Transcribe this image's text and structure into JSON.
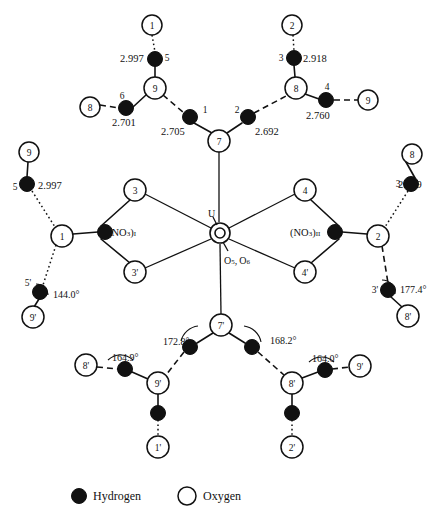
{
  "page": {
    "corner_mark": "",
    "figure_type": "molecular-hydrogen-bonding-diagram"
  },
  "legend": {
    "hydrogen_label": "Hydrogen",
    "oxygen_label": "Oxygen",
    "hydrogen_color": "#111111",
    "oxygen_color": "#ffffff"
  },
  "center": {
    "metal_label": "U",
    "axial_oxygen_label": "O",
    "axial_oxygen_sub": "5, 6",
    "axial_oxygen_full": "O5, O6"
  },
  "nitrate_groups": [
    {
      "name": "(NO3)I",
      "base": "(NO",
      "sub1": "3",
      "close": ")",
      "sub2": "I",
      "x": 108,
      "y": 232
    },
    {
      "name": "(NO3)II",
      "base": "(NO",
      "sub1": "3",
      "close": ")",
      "sub2": "II",
      "x": 283,
      "y": 232
    }
  ],
  "oxygen_atoms": [
    {
      "id": "O1-top",
      "label": "1",
      "x": 152,
      "y": 25,
      "r": 10
    },
    {
      "id": "O2-top",
      "label": "2",
      "x": 292,
      "y": 25,
      "r": 10
    },
    {
      "id": "O9-top",
      "label": "9",
      "x": 155,
      "y": 88,
      "r": 11
    },
    {
      "id": "O8-top",
      "label": "8",
      "x": 296,
      "y": 88,
      "r": 11
    },
    {
      "id": "O8-left",
      "label": "8",
      "x": 90,
      "y": 107,
      "r": 10
    },
    {
      "id": "O9-right",
      "label": "9",
      "x": 368,
      "y": 100,
      "r": 10
    },
    {
      "id": "O7",
      "label": "7",
      "x": 219,
      "y": 141,
      "r": 11
    },
    {
      "id": "O9-upleft",
      "label": "9",
      "x": 29,
      "y": 152,
      "r": 10
    },
    {
      "id": "O8-upright",
      "label": "8",
      "x": 412,
      "y": 154,
      "r": 10
    },
    {
      "id": "O1-left",
      "label": "1",
      "x": 62,
      "y": 236,
      "r": 11
    },
    {
      "id": "O2-right",
      "label": "2",
      "x": 378,
      "y": 236,
      "r": 11
    },
    {
      "id": "O3",
      "label": "3",
      "x": 135,
      "y": 190,
      "r": 11
    },
    {
      "id": "O3p",
      "label": "3'",
      "x": 135,
      "y": 272,
      "r": 11
    },
    {
      "id": "O4",
      "label": "4",
      "x": 305,
      "y": 190,
      "r": 11
    },
    {
      "id": "O4p",
      "label": "4'",
      "x": 305,
      "y": 272,
      "r": 11
    },
    {
      "id": "O9p-left",
      "label": "9'",
      "x": 33,
      "y": 317,
      "r": 11
    },
    {
      "id": "O8p-right",
      "label": "8'",
      "x": 408,
      "y": 316,
      "r": 11
    },
    {
      "id": "O7p",
      "label": "7'",
      "x": 221,
      "y": 325,
      "r": 11
    },
    {
      "id": "O9p-mid",
      "label": "9'",
      "x": 158,
      "y": 383,
      "r": 11
    },
    {
      "id": "O8p-mid",
      "label": "8'",
      "x": 292,
      "y": 383,
      "r": 11
    },
    {
      "id": "O8p-far",
      "label": "8'",
      "x": 86,
      "y": 365,
      "r": 11
    },
    {
      "id": "O9p-far",
      "label": "9'",
      "x": 360,
      "y": 366,
      "r": 11
    },
    {
      "id": "O1p",
      "label": "1'",
      "x": 158,
      "y": 447,
      "r": 11
    },
    {
      "id": "O2p",
      "label": "2'",
      "x": 292,
      "y": 447,
      "r": 11
    }
  ],
  "hydrogen_atoms": [
    {
      "id": "H5-top",
      "label": "5",
      "label_x": 167,
      "label_y": 58,
      "x": 155,
      "y": 59,
      "r": 7.5
    },
    {
      "id": "H3-top",
      "label": "3",
      "label_x": 281,
      "label_y": 58,
      "x": 294,
      "y": 58,
      "r": 7.5
    },
    {
      "id": "H6",
      "label": "6",
      "label_x": 122,
      "label_y": 96,
      "x": 126,
      "y": 108,
      "r": 7.5
    },
    {
      "id": "H4",
      "label": "4",
      "label_x": 327,
      "label_y": 87,
      "x": 326,
      "y": 100,
      "r": 7.5
    },
    {
      "id": "H1",
      "label": "1",
      "label_x": 205,
      "label_y": 110,
      "x": 190,
      "y": 117,
      "r": 7.5
    },
    {
      "id": "H2",
      "label": "2",
      "label_x": 237,
      "label_y": 110,
      "x": 248,
      "y": 117,
      "r": 7.5
    },
    {
      "id": "H5-left",
      "label": "5",
      "label_x": 15,
      "label_y": 187,
      "x": 27,
      "y": 184,
      "r": 7.5
    },
    {
      "id": "H3-right",
      "label": "3",
      "label_x": 398,
      "label_y": 184,
      "x": 411,
      "y": 184,
      "r": 7.5
    },
    {
      "id": "H-no3-1",
      "label": "",
      "label_x": 0,
      "label_y": 0,
      "x": 105,
      "y": 232,
      "r": 7.5
    },
    {
      "id": "H-no3-2",
      "label": "",
      "label_x": 0,
      "label_y": 0,
      "x": 335,
      "y": 232,
      "r": 7.5
    },
    {
      "id": "H5p",
      "label": "5'",
      "label_x": 28,
      "label_y": 283,
      "x": 40,
      "y": 292,
      "r": 7.5
    },
    {
      "id": "H3p",
      "label": "3'",
      "label_x": 375,
      "label_y": 290,
      "x": 388,
      "y": 290,
      "r": 7.5
    },
    {
      "id": "H-7p-left",
      "label": "",
      "label_x": 0,
      "label_y": 0,
      "x": 190,
      "y": 347,
      "r": 7.5
    },
    {
      "id": "H-7p-right",
      "label": "",
      "label_x": 0,
      "label_y": 0,
      "x": 252,
      "y": 347,
      "r": 7.5
    },
    {
      "id": "H-9p-left",
      "label": "",
      "label_x": 0,
      "label_y": 0,
      "x": 125,
      "y": 369,
      "r": 7.5
    },
    {
      "id": "H-8p-right",
      "label": "",
      "label_x": 0,
      "label_y": 0,
      "x": 325,
      "y": 370,
      "r": 7.5
    },
    {
      "id": "H-9p-down",
      "label": "",
      "label_x": 0,
      "label_y": 0,
      "x": 158,
      "y": 413,
      "r": 7.5
    },
    {
      "id": "H-8p-down",
      "label": "",
      "label_x": 0,
      "label_y": 0,
      "x": 292,
      "y": 413,
      "r": 7.5
    }
  ],
  "distances": [
    {
      "value": "2.997",
      "x": 120,
      "y": 58,
      "anchor": "start"
    },
    {
      "value": "2.918",
      "x": 303,
      "y": 58,
      "anchor": "start"
    },
    {
      "value": "2.701",
      "x": 112,
      "y": 122,
      "anchor": "start"
    },
    {
      "value": "2.760",
      "x": 306,
      "y": 115,
      "anchor": "start"
    },
    {
      "value": "2.705",
      "x": 161,
      "y": 131,
      "anchor": "start"
    },
    {
      "value": "2.692",
      "x": 255,
      "y": 131,
      "anchor": "start"
    },
    {
      "value": "2.997",
      "x": 38,
      "y": 185,
      "anchor": "start"
    },
    {
      "value": "2.919",
      "x": 398,
      "y": 184,
      "anchor": "start"
    }
  ],
  "angles": [
    {
      "value": "144.0°",
      "x": 53,
      "y": 294
    },
    {
      "value": "177.4°",
      "x": 400,
      "y": 289
    },
    {
      "value": "172.8°",
      "x": 163,
      "y": 341
    },
    {
      "value": "168.2°",
      "x": 270,
      "y": 340
    },
    {
      "value": "164.9°",
      "x": 112,
      "y": 357
    },
    {
      "value": "164.0°",
      "x": 312,
      "y": 358
    }
  ],
  "chart_data": {
    "type": "diagram",
    "legend": [
      "Hydrogen",
      "Oxygen"
    ],
    "center_atom": "U",
    "axial_oxygens": [
      "O5",
      "O6"
    ],
    "ligands": [
      "(NO3)I",
      "(NO3)II"
    ],
    "hydrogen_bond_distances_angstrom": [
      2.997,
      2.918,
      2.701,
      2.76,
      2.705,
      2.692,
      2.997,
      2.919
    ],
    "hydrogen_bond_angles_degrees": [
      144.0,
      177.4,
      172.8,
      168.2,
      164.9,
      164.0
    ]
  }
}
